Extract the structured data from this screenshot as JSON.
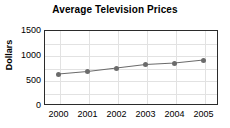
{
  "chart_data": {
    "type": "line",
    "title": "Average Television Prices",
    "xlabel": "",
    "ylabel": "Dollars",
    "x": [
      "2000",
      "2001",
      "2002",
      "2003",
      "2004",
      "2005"
    ],
    "categories": [
      "2000",
      "2001",
      "2002",
      "2003",
      "2004",
      "2005"
    ],
    "values": [
      620,
      670,
      740,
      810,
      840,
      900
    ],
    "series": [
      {
        "name": "Average Television Price",
        "values": [
          620,
          670,
          740,
          810,
          840,
          900
        ]
      }
    ],
    "ylim": [
      0,
      1500
    ],
    "y_ticks": [
      0,
      500,
      1000,
      1500
    ],
    "y_tick_labels": [
      "0",
      "500",
      "1000",
      "1500"
    ],
    "x_tick_labels": [
      "2000",
      "2001",
      "2002",
      "2003",
      "2004",
      "2005"
    ],
    "grid": true,
    "grid_horizontal_step": 250,
    "legend": false,
    "legend_position": "none",
    "marker": "circle",
    "colors": {
      "line": "#6b6b6b",
      "marker": "#6b6b6b",
      "grid": "#e2e2e2",
      "axis": "#2b2b2b",
      "text": "#000000",
      "background": "#ffffff"
    }
  }
}
